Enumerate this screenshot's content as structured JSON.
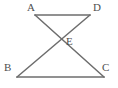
{
  "figure": {
    "kind": "geometry-diagram",
    "background_color": "#ffffff",
    "stroke_color": "#6d6d6d",
    "label_color": "#4f4f4f",
    "stroke_width": 1.6,
    "width": 118,
    "height": 88,
    "points": {
      "A": {
        "label": "A",
        "x": 35,
        "y": 15
      },
      "D": {
        "label": "D",
        "x": 90,
        "y": 15
      },
      "B": {
        "label": "B",
        "x": 17,
        "y": 77
      },
      "C": {
        "label": "C",
        "x": 104,
        "y": 77
      },
      "E": {
        "label": "E",
        "x": 61,
        "y": 40
      }
    },
    "segments": [
      {
        "name": "AD",
        "from": "A",
        "to": "D",
        "x1": 35,
        "y1": 15,
        "x2": 90,
        "y2": 15
      },
      {
        "name": "BC",
        "from": "B",
        "to": "C",
        "x1": 17,
        "y1": 77,
        "x2": 104,
        "y2": 77
      },
      {
        "name": "AC",
        "from": "A",
        "to": "C",
        "x1": 35,
        "y1": 15,
        "x2": 104,
        "y2": 77
      },
      {
        "name": "DB",
        "from": "D",
        "to": "B",
        "x1": 90,
        "y1": 15,
        "x2": 17,
        "y2": 77
      }
    ]
  }
}
